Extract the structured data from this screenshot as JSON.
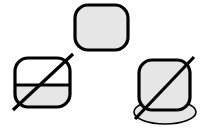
{
  "canvas": {
    "width": 205,
    "height": 131,
    "background": "#ffffff"
  },
  "style": {
    "outline_color": "#000000",
    "fill_gray": "#e6e6e6",
    "fill_white": "#ffffff",
    "thick_stroke_width": 3.2,
    "thin_stroke_width": 1.6,
    "slash_stroke_width": 3.2
  },
  "shapes": [
    {
      "id": "shape-top",
      "name": "rounded-rectangle-filled",
      "role": "accepted-example",
      "x": 75,
      "y": 5,
      "width": 53,
      "height": 45,
      "corner_radius": 13,
      "fill": "#e6e6e6",
      "stroke": "#000000",
      "stroke_width": 3.2,
      "crossed_out": false,
      "has_base_ellipse": false,
      "split_fill": false
    },
    {
      "id": "shape-bottom-left",
      "name": "rounded-rectangle-half-filled",
      "role": "rejected-example",
      "x": 15,
      "y": 58,
      "width": 55,
      "height": 49,
      "corner_radius": 13,
      "fill": "#e6e6e6",
      "top_half_fill": "#ffffff",
      "bottom_half_fill": "#e6e6e6",
      "divider_y": 85,
      "stroke": "#000000",
      "stroke_width": 3.2,
      "crossed_out": true,
      "has_base_ellipse": false,
      "split_fill": true
    },
    {
      "id": "shape-bottom-right",
      "name": "rounded-rectangle-on-ellipse-base",
      "role": "rejected-example",
      "x": 139,
      "y": 60,
      "width": 51,
      "height": 50,
      "corner_radius": 13,
      "fill": "#e6e6e6",
      "stroke": "#000000",
      "stroke_width": 3.2,
      "crossed_out": true,
      "has_base_ellipse": true,
      "split_fill": false,
      "base_ellipse": {
        "cx": 165,
        "cy": 112,
        "rx": 31,
        "ry": 12,
        "fill": "#e6e6e6",
        "stroke": "#000000",
        "stroke_width": 1.6
      }
    }
  ],
  "slashes": [
    {
      "id": "slash-bottom-left",
      "name": "strikethrough-diagonal",
      "x1": 13,
      "y1": 110,
      "x2": 73,
      "y2": 54,
      "stroke": "#000000",
      "stroke_width": 3.2
    },
    {
      "id": "slash-bottom-right",
      "name": "strikethrough-diagonal",
      "x1": 135,
      "y1": 119,
      "x2": 194,
      "y2": 57,
      "stroke": "#000000",
      "stroke_width": 3.2
    }
  ]
}
